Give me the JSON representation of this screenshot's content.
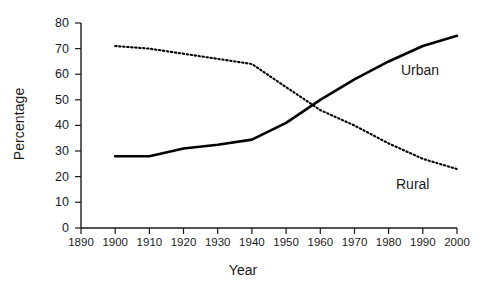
{
  "chart_data": {
    "type": "line",
    "title": "",
    "xlabel": "Year",
    "ylabel": "Percentage",
    "x": [
      1900,
      1910,
      1920,
      1930,
      1940,
      1950,
      1960,
      1970,
      1980,
      1990,
      2000
    ],
    "xlim": [
      1890,
      2000
    ],
    "ylim": [
      0,
      80
    ],
    "xticks": [
      1890,
      1900,
      1910,
      1920,
      1930,
      1940,
      1950,
      1960,
      1970,
      1980,
      1990,
      2000
    ],
    "yticks": [
      0,
      10,
      20,
      30,
      40,
      50,
      60,
      70,
      80
    ],
    "grid": false,
    "legend": "inline-annotations",
    "series": [
      {
        "name": "Urban",
        "style": "solid",
        "color": "#000000",
        "values": [
          28,
          28,
          31,
          32.5,
          34.5,
          41,
          50,
          58,
          65,
          71,
          75
        ],
        "annotation": "Urban"
      },
      {
        "name": "Rural",
        "style": "dotted",
        "color": "#000000",
        "values": [
          71,
          70,
          68,
          66,
          64,
          55,
          46,
          40,
          33,
          27,
          23
        ],
        "annotation": "Rural"
      }
    ],
    "annotations": [
      {
        "text": "Urban",
        "x": 1983,
        "y": 62
      },
      {
        "text": "Rural",
        "x": 1981,
        "y": 17
      }
    ]
  },
  "axes": {
    "ylabel": "Percentage",
    "xlabel": "Year",
    "ytick_labels": [
      "80",
      "70",
      "60",
      "50",
      "40",
      "30",
      "20",
      "10",
      "0"
    ],
    "xtick_labels": [
      "1890",
      "1900",
      "1910",
      "1920",
      "1930",
      "1940",
      "1950",
      "1960",
      "1970",
      "1980",
      "1990",
      "2000"
    ]
  }
}
